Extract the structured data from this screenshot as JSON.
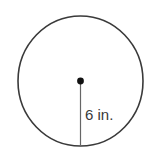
{
  "diagram": {
    "shape": "circle",
    "center": {
      "x": 80.5,
      "y": 81
    },
    "radius_px": {
      "rx": 62.5,
      "ry": 65
    },
    "radius_label": "6 in.",
    "colors": {
      "stroke": "#3a3a3a",
      "line": "#555555",
      "dot": "#111111"
    }
  }
}
